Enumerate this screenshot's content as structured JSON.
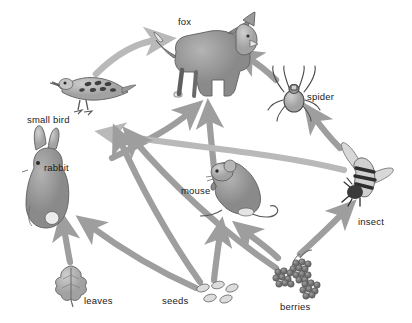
{
  "diagram": {
    "type": "food-web",
    "background_color": "#ffffff",
    "arrow_colors": {
      "dark": "#8f8f8f",
      "medium": "#9e9e9e",
      "light": "#b9b9b9"
    },
    "label_color": "#1a1a1a"
  },
  "organisms": [
    {
      "id": "fox",
      "label": "fox",
      "label_x": 178,
      "label_y": 17,
      "art_x": 160,
      "art_y": 12,
      "art_w": 95,
      "art_h": 95,
      "trophic": "predator"
    },
    {
      "id": "spider",
      "label": "spider",
      "label_x": 307,
      "label_y": 92,
      "art_x": 267,
      "art_y": 66,
      "art_w": 50,
      "art_h": 56,
      "trophic": "predator"
    },
    {
      "id": "small_bird",
      "label": "small bird",
      "label_x": 27,
      "label_y": 115,
      "art_x": 52,
      "art_y": 76,
      "art_w": 78,
      "art_h": 55,
      "trophic": "consumer"
    },
    {
      "id": "rabbit",
      "label": "rabbit",
      "label_x": 44,
      "label_y": 163,
      "art_x": 18,
      "art_y": 140,
      "art_w": 54,
      "art_h": 88,
      "trophic": "consumer"
    },
    {
      "id": "mouse",
      "label": "mouse",
      "label_x": 181,
      "label_y": 186,
      "art_x": 200,
      "art_y": 160,
      "art_w": 78,
      "art_h": 64,
      "trophic": "consumer"
    },
    {
      "id": "insect",
      "label": "insect",
      "label_x": 358,
      "label_y": 217,
      "art_x": 337,
      "art_y": 148,
      "art_w": 58,
      "art_h": 62,
      "trophic": "consumer"
    },
    {
      "id": "leaves",
      "label": "leaves",
      "label_x": 84,
      "label_y": 296,
      "art_x": 54,
      "art_y": 263,
      "art_w": 38,
      "art_h": 42,
      "trophic": "producer"
    },
    {
      "id": "seeds",
      "label": "seeds",
      "label_x": 162,
      "label_y": 296,
      "art_x": 196,
      "art_y": 282,
      "art_w": 46,
      "art_h": 26,
      "trophic": "producer"
    },
    {
      "id": "berries",
      "label": "berries",
      "label_x": 280,
      "label_y": 302,
      "art_x": 276,
      "art_y": 254,
      "art_w": 56,
      "art_h": 48,
      "trophic": "producer"
    }
  ],
  "links": [
    {
      "from": "small_bird",
      "to": "fox",
      "shade": "light"
    },
    {
      "from": "spider",
      "to": "fox",
      "shade": "medium"
    },
    {
      "from": "rabbit",
      "to": "fox",
      "shade": "medium"
    },
    {
      "from": "mouse",
      "to": "fox",
      "shade": "medium"
    },
    {
      "from": "insect",
      "to": "spider",
      "shade": "medium"
    },
    {
      "from": "insect",
      "to": "small_bird",
      "shade": "light"
    },
    {
      "from": "seeds",
      "to": "small_bird",
      "shade": "medium"
    },
    {
      "from": "berries",
      "to": "small_bird",
      "shade": "medium"
    },
    {
      "from": "seeds",
      "to": "rabbit",
      "shade": "medium"
    },
    {
      "from": "leaves",
      "to": "rabbit",
      "shade": "medium"
    },
    {
      "from": "seeds",
      "to": "mouse",
      "shade": "medium"
    },
    {
      "from": "berries",
      "to": "mouse",
      "shade": "medium"
    },
    {
      "from": "berries",
      "to": "insect",
      "shade": "medium"
    }
  ]
}
